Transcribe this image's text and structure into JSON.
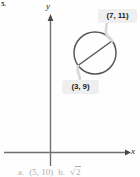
{
  "exercise": {
    "number": "5."
  },
  "graph": {
    "axis_labels": {
      "x": "x",
      "y": "y"
    },
    "shape": {
      "name": "circle-with-diameter",
      "circle": {
        "cx": 95,
        "cy": 53,
        "r": 21
      },
      "diameter_endpoints": [
        {
          "x": 78,
          "y": 66
        },
        {
          "x": 112,
          "y": 41
        }
      ]
    },
    "callouts": [
      {
        "id": "endpoint-upper-right",
        "label": "(7, 11)"
      },
      {
        "id": "endpoint-lower-left",
        "label": "(3, 9)"
      }
    ]
  },
  "answer_line": {
    "part_a_label": "a.",
    "part_a_value": "(5, 10)",
    "part_b_label": "b.",
    "part_b_radicand": "2"
  },
  "colors": {
    "ink": "#231f20",
    "axis": "#6f6f72",
    "curve": "#58585b",
    "bubble_fill": "#efeff0",
    "background": "#fefefe"
  }
}
